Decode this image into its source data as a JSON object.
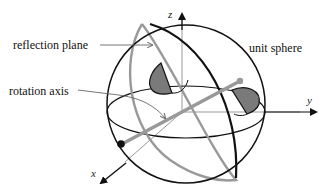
{
  "figure": {
    "type": "diagram"
  },
  "labels": {
    "reflection_plane": "reflection plane",
    "rotation_axis": "rotation axis",
    "unit_sphere": "unit sphere"
  },
  "axes": {
    "x": "x",
    "y": "y",
    "z": "z"
  },
  "colors": {
    "sphere_outline": "#111111",
    "great_circle_dark": "#111111",
    "reflection_plane_circle": "#999999",
    "rotation_axis": "#999999",
    "coordinate_axes": "#999999",
    "shaded_shapes": "#7a7a7a",
    "background": "#ffffff"
  }
}
